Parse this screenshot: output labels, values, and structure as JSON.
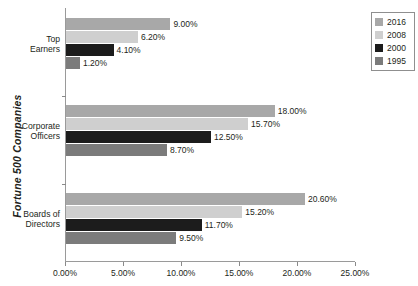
{
  "chart_data": {
    "type": "bar",
    "orientation": "horizontal",
    "title": "",
    "xlabel": "",
    "ylabel": "Fortune 500 Companies",
    "categories": [
      "Top Earners",
      "Corporate Officers",
      "Boards of Directors"
    ],
    "series": [
      {
        "name": "2016",
        "color": "#a8a8a8",
        "values": [
          9.0,
          18.0,
          20.6
        ],
        "labels": [
          "9.00%",
          "18.00%",
          "20.60%"
        ]
      },
      {
        "name": "2008",
        "color": "#cfcfcf",
        "values": [
          6.2,
          15.7,
          15.2
        ],
        "labels": [
          "6.20%",
          "15.70%",
          "15.20%"
        ]
      },
      {
        "name": "2000",
        "color": "#1c1c1c",
        "values": [
          4.1,
          12.5,
          11.7
        ],
        "labels": [
          "4.10%",
          "12.50%",
          "11.70%"
        ]
      },
      {
        "name": "1995",
        "color": "#7b7b7b",
        "values": [
          1.2,
          8.7,
          9.5
        ],
        "labels": [
          "1.20%",
          "8.70%",
          "9.50%"
        ]
      }
    ],
    "xlim": [
      0,
      25
    ],
    "xticks": [
      0,
      5,
      10,
      15,
      20,
      25
    ],
    "xtick_labels": [
      "0.00%",
      "5.00%",
      "10.00%",
      "15.00%",
      "20.00%",
      "25.00%"
    ],
    "grid": false,
    "legend_position": "right-top"
  },
  "legend": {
    "items": [
      {
        "label": "2016",
        "color": "#a8a8a8"
      },
      {
        "label": "2008",
        "color": "#cfcfcf"
      },
      {
        "label": "2000",
        "color": "#1c1c1c"
      },
      {
        "label": "1995",
        "color": "#7b7b7b"
      }
    ]
  },
  "axis": {
    "y_title": "Fortune 500 Companies",
    "category_labels": [
      {
        "line1": "Top",
        "line2": "Earners"
      },
      {
        "line1": "Corporate",
        "line2": "Officers"
      },
      {
        "line1": "Boards of",
        "line2": "Directors"
      }
    ]
  }
}
